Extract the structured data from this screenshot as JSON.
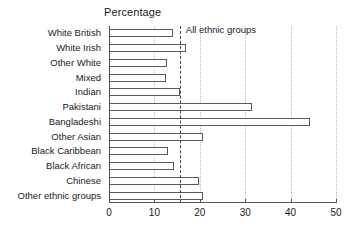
{
  "chart_data": {
    "type": "bar",
    "orientation": "horizontal",
    "title": "Percentage",
    "xlabel": "",
    "ylabel": "",
    "xlim": [
      0,
      50
    ],
    "xticks": [
      0,
      10,
      20,
      30,
      40,
      50
    ],
    "xtick_labels": [
      "0",
      "10",
      "20",
      "30",
      "40",
      "50"
    ],
    "grid": true,
    "grid_axis": "x",
    "legend": "none",
    "categories": [
      "White British",
      "White Irish",
      "Other White",
      "Mixed",
      "Indian",
      "Pakistani",
      "Bangladeshi",
      "Other Asian",
      "Black Caribbean",
      "Black African",
      "Chinese",
      "Other ethnic groups"
    ],
    "values": [
      14.2,
      17.0,
      12.8,
      12.6,
      15.6,
      31.5,
      44.2,
      20.6,
      13.0,
      14.4,
      19.9,
      20.8
    ],
    "annotations": [
      {
        "name": "all-ethnic-groups-reference",
        "label": "All ethnic groups",
        "value": 15.6,
        "style": "dashed-vertical-line"
      }
    ],
    "colors": {
      "bar_fill": "#ffffff",
      "bar_stroke": "#5a5a5a",
      "axis": "#555555",
      "gridline": "#b9b9b9",
      "reference_line": "#444444",
      "text": "#1a1a1a",
      "background": "#ffffff"
    }
  }
}
